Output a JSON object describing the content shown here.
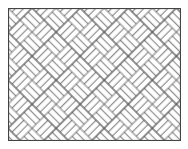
{
  "figure": {
    "pattern": {
      "type": "basketweave",
      "rotation_deg": 45,
      "strips_per_block": 3,
      "block_size_px": 17
    },
    "colors": {
      "background": "#ffffff",
      "line": "#555555",
      "frame": "#444444"
    }
  }
}
